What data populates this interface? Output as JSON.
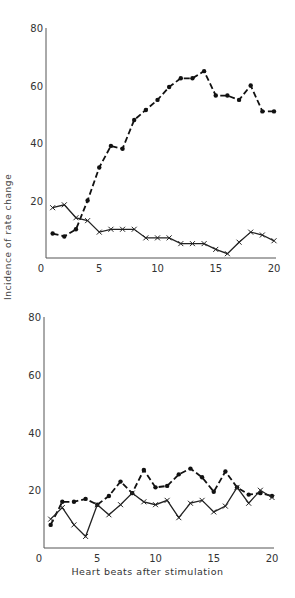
{
  "chart_data": [
    {
      "type": "line",
      "title": "",
      "xlabel": "Heart beats after stimulation",
      "ylabel": "Incidence of rate change",
      "xlim": [
        0,
        20
      ],
      "ylim": [
        0,
        80
      ],
      "x_ticks": [
        0,
        5,
        10,
        15,
        20
      ],
      "y_ticks": [
        20,
        40,
        60,
        80
      ],
      "grid": false,
      "x": [
        1,
        2,
        3,
        4,
        5,
        6,
        7,
        8,
        9,
        10,
        11,
        12,
        13,
        14,
        15,
        16,
        17,
        18,
        19,
        20
      ],
      "series": [
        {
          "name": "dashed-dots",
          "style": "dashed",
          "marker": "dot",
          "values": [
            8.5,
            7.5,
            10,
            20,
            31.5,
            39,
            38,
            48,
            51.5,
            55,
            59.5,
            62.5,
            62.5,
            65,
            56.5,
            56.5,
            55,
            60,
            51,
            51
          ]
        },
        {
          "name": "solid-crosses",
          "style": "solid",
          "marker": "x",
          "values": [
            17.5,
            18.5,
            14,
            13,
            9,
            10,
            10,
            10,
            7,
            7,
            7,
            5,
            5,
            5,
            3,
            1.5,
            5.5,
            9,
            8,
            6
          ]
        }
      ]
    },
    {
      "type": "line",
      "title": "",
      "xlabel": "Heart beats after stimulation",
      "ylabel": "Incidence of rate change",
      "xlim": [
        0,
        20
      ],
      "ylim": [
        0,
        80
      ],
      "x_ticks": [
        0,
        5,
        10,
        15,
        20
      ],
      "y_ticks": [
        20,
        40,
        60,
        80
      ],
      "grid": false,
      "x": [
        1,
        2,
        3,
        4,
        5,
        6,
        7,
        8,
        9,
        10,
        11,
        12,
        13,
        14,
        15,
        16,
        17,
        18,
        19,
        20
      ],
      "series": [
        {
          "name": "dashed-dots",
          "style": "dashed",
          "marker": "dot",
          "values": [
            8,
            16,
            16,
            17,
            15,
            18,
            23,
            19,
            27,
            21,
            21.5,
            25.5,
            27.5,
            24.5,
            19.5,
            26.5,
            21,
            18.5,
            19,
            18
          ]
        },
        {
          "name": "solid-crosses",
          "style": "solid",
          "marker": "x",
          "values": [
            10,
            14,
            8,
            4,
            15,
            11.5,
            15,
            19,
            16,
            15,
            16.5,
            10.5,
            15.5,
            16.5,
            12.5,
            14.5,
            21,
            15.5,
            20,
            17.5
          ]
        }
      ]
    }
  ],
  "labels": {
    "y_axis": "Incidence of rate change",
    "x_axis": "Heart beats after stimulation"
  }
}
